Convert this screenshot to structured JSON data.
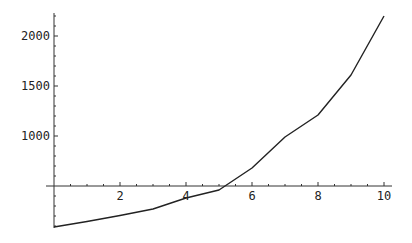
{
  "chart_data": {
    "type": "line",
    "title": "",
    "xlabel": "",
    "ylabel": "",
    "x": [
      0,
      1,
      2,
      3,
      4,
      5,
      6,
      7,
      8,
      9,
      10
    ],
    "series": [
      {
        "name": "series-1",
        "values": [
          90,
          145,
          205,
          270,
          380,
          460,
          680,
          990,
          1210,
          1610,
          2200
        ]
      }
    ],
    "xlim": [
      0,
      10
    ],
    "ylim": [
      80,
      2230
    ],
    "axes_origin": {
      "x": 0,
      "y": 500
    },
    "x_ticks": [
      2,
      4,
      6,
      8,
      10
    ],
    "x_tick_labels": [
      "2",
      "4",
      "6",
      "8",
      "10"
    ],
    "y_ticks": [
      1000,
      1500,
      2000
    ],
    "y_tick_labels": [
      "1000",
      "1500",
      "2000"
    ],
    "grid": false,
    "legend": null,
    "line_color": "#222222"
  }
}
